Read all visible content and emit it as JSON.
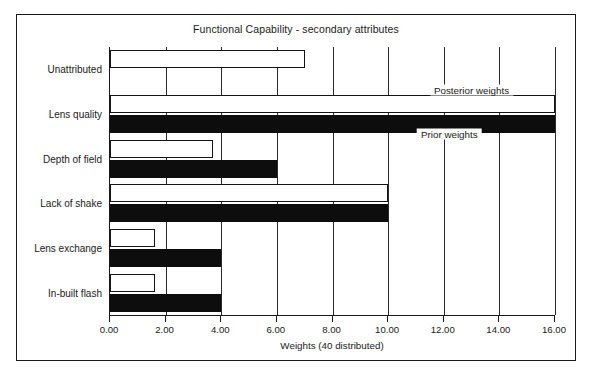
{
  "chart_data": {
    "type": "bar",
    "orientation": "horizontal",
    "title": "Functional Capability - secondary attributes",
    "xlabel": "Weights (40 distributed)",
    "ylabel": "",
    "xlim": [
      0,
      16
    ],
    "xticks": [
      "0.00",
      "2.00",
      "4.00",
      "6.00",
      "8.00",
      "10.00",
      "12.00",
      "14.00",
      "16.00"
    ],
    "xtick_values": [
      0,
      2,
      4,
      6,
      8,
      10,
      12,
      14,
      16
    ],
    "grid": "vertical",
    "legend_position": "in-plot-annotations",
    "categories": [
      "Unattributed",
      "Lens quality",
      "Depth of field",
      "Lack of shake",
      "Lens exchange",
      "In-built flash"
    ],
    "series": [
      {
        "name": "Posterior weights",
        "color": "#ffffff",
        "edge_color": "#141414",
        "values": [
          7.0,
          16.0,
          3.7,
          10.0,
          1.6,
          1.6
        ]
      },
      {
        "name": "Prior weights",
        "color": "#0d0d0d",
        "edge_color": "#0d0d0d",
        "values": [
          0.0,
          16.0,
          6.0,
          10.0,
          4.0,
          4.0
        ]
      }
    ],
    "annotations": [
      {
        "text": "Posterior weights",
        "x": 13.0,
        "y_category": "Lens quality",
        "position": "above-bar"
      },
      {
        "text": "Prior weights",
        "x": 12.2,
        "y_category": "Depth of field",
        "position": "above-bar"
      }
    ]
  },
  "colors": {
    "background": "#ffffff",
    "ink": "#1a1a1a",
    "prior_fill": "#0d0d0d",
    "posterior_fill": "#ffffff",
    "gridline": "#2b2b2b"
  }
}
